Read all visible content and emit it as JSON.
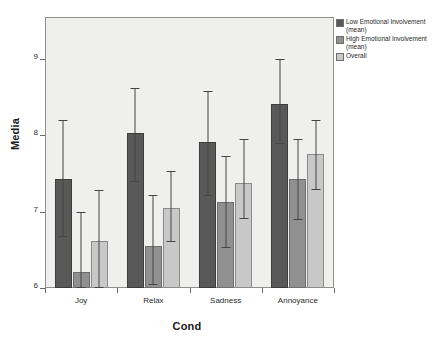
{
  "chart_data": {
    "type": "bar",
    "title": "",
    "xlabel": "Cond",
    "ylabel": "Media",
    "categories": [
      "Joy",
      "Relax",
      "Sadness",
      "Annoyance"
    ],
    "ylim": [
      6,
      9.4
    ],
    "yticks": [
      6,
      7,
      8,
      9
    ],
    "ytick_labels": [
      "6",
      "7",
      "8",
      "9"
    ],
    "grid": false,
    "legend_position": "right-top",
    "series": [
      {
        "name": "Low Emotional Involvement (mean)",
        "color": "#595959",
        "values": [
          7.42,
          8.03,
          7.91,
          8.41
        ],
        "err_low": [
          6.66,
          7.38,
          7.2,
          7.88
        ],
        "err_high": [
          8.2,
          8.62,
          8.58,
          9.0
        ]
      },
      {
        "name": "High Emotional Involvement (mean)",
        "color": "#909090",
        "values": [
          6.21,
          6.55,
          7.12,
          7.42
        ],
        "err_low": [
          6.0,
          6.04,
          6.52,
          6.89
        ],
        "err_high": [
          7.0,
          7.22,
          7.72,
          7.95
        ]
      },
      {
        "name": "Overall",
        "color": "#c8c8c8",
        "values": [
          6.62,
          7.05,
          7.37,
          7.75
        ],
        "err_low": [
          6.0,
          6.6,
          6.9,
          7.28
        ],
        "err_high": [
          7.28,
          7.53,
          7.95,
          8.2
        ]
      }
    ]
  },
  "legend": {
    "entries": [
      {
        "label": "Low Emotional Involvement (mean)",
        "color": "#595959"
      },
      {
        "label": "High Emotional Involvement (mean)",
        "color": "#909090"
      },
      {
        "label": "Overall",
        "color": "#c8c8c8"
      }
    ]
  },
  "axes": {
    "y_title": "Media",
    "x_title": "Cond"
  },
  "colors": {
    "plot_background": "#efefee",
    "frame": "#8f8f8f",
    "error_bar": "#454545",
    "text": "#1a1a1a"
  }
}
